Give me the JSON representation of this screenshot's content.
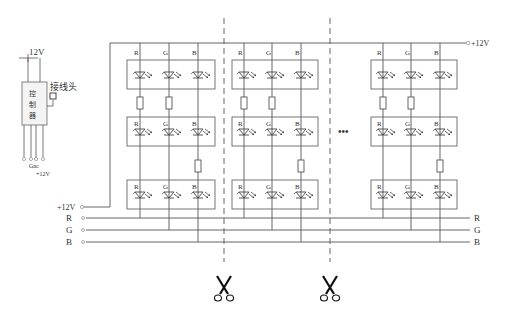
{
  "controller": {
    "top_label": "12V",
    "chars": [
      "控",
      "制",
      "器"
    ],
    "connector_label": "接线头",
    "bottom_label_1": "Gnc",
    "bottom_label_2": "+12V"
  },
  "power": {
    "top_right_label": "+12V",
    "left_label": "+12V"
  },
  "bus": {
    "left": [
      "R",
      "G",
      "B"
    ],
    "right": [
      "R",
      "G",
      "B"
    ]
  },
  "led_channels": [
    "R",
    "G",
    "B"
  ],
  "ellipsis": "•••",
  "colors": {
    "line": "#555555",
    "box": "#666666",
    "dash": "#555555",
    "text": "#333333"
  }
}
